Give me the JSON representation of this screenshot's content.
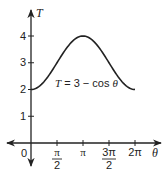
{
  "chart_data": {
    "type": "line",
    "title": "",
    "xlabel": "θ",
    "ylabel": "T",
    "annotation": "T = 3 − cos θ",
    "function": "T = 3 - cos(theta)",
    "xlim": [
      0,
      6.2832
    ],
    "ylim": [
      0,
      4
    ],
    "x_ticks": [
      "0",
      "π/2",
      "π",
      "3π/2",
      "2π"
    ],
    "x_tick_values": [
      0,
      1.5708,
      3.1416,
      4.7124,
      6.2832
    ],
    "y_ticks": [
      "1",
      "2",
      "3",
      "4"
    ],
    "y_tick_values": [
      1,
      2,
      3,
      4
    ],
    "series": [
      {
        "name": "T = 3 − cos θ",
        "x": [
          0,
          0.7854,
          1.5708,
          2.3562,
          3.1416,
          3.927,
          4.7124,
          5.4978,
          6.2832
        ],
        "values": [
          2,
          2.293,
          3,
          3.707,
          4,
          3.707,
          3,
          2.293,
          2
        ]
      }
    ],
    "grid": false,
    "legend": "none"
  },
  "labels": {
    "y_axis": "T",
    "x_axis": "θ",
    "origin": "0",
    "y1": "1",
    "y2": "2",
    "y3": "3",
    "y4": "4",
    "x_pi_half_num": "π",
    "x_pi_half_den": "2",
    "x_pi": "π",
    "x_3pi_half_num": "3π",
    "x_3pi_half_den": "2",
    "x_2pi": "2π",
    "eq_T": "T",
    "eq_rest": " = 3 − cos ",
    "eq_theta": "θ"
  }
}
